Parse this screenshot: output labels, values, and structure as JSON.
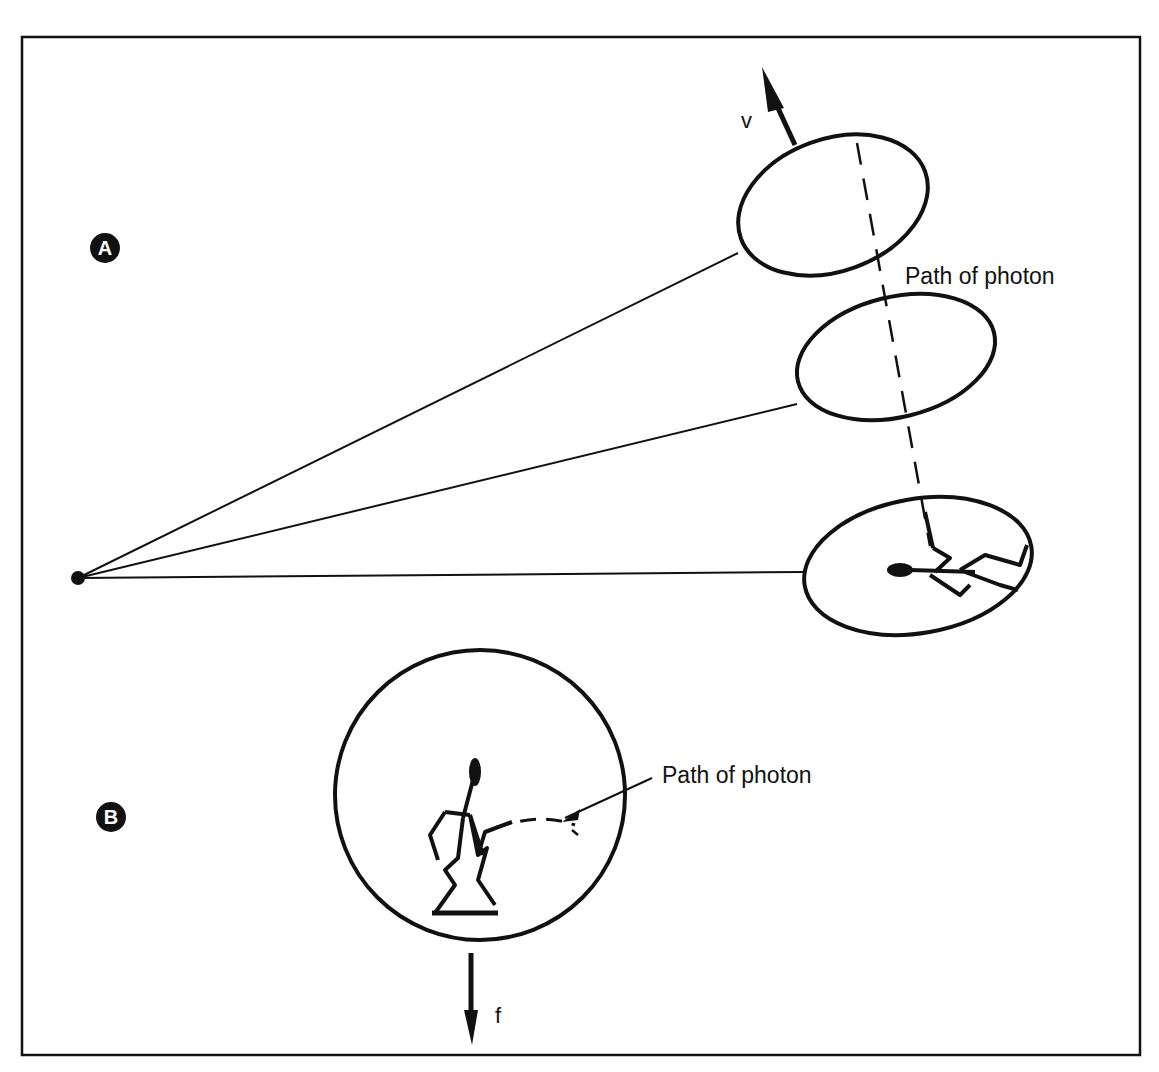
{
  "figure": {
    "panels": [
      {
        "id": "A",
        "badge": "A",
        "photon_label": "Path of photon",
        "vector_label": "v",
        "description": "Three successive positions of a moving ellipse viewed from a point source; dashed photon path crosses them; stick figure inside lowest ellipse"
      },
      {
        "id": "B",
        "badge": "B",
        "photon_label": "Path of photon",
        "vector_label": "f",
        "description": "Circle with stick figure; curved dashed photon path; downward force arrow"
      }
    ],
    "colors": {
      "ink": "#111111",
      "background": "#ffffff"
    }
  }
}
